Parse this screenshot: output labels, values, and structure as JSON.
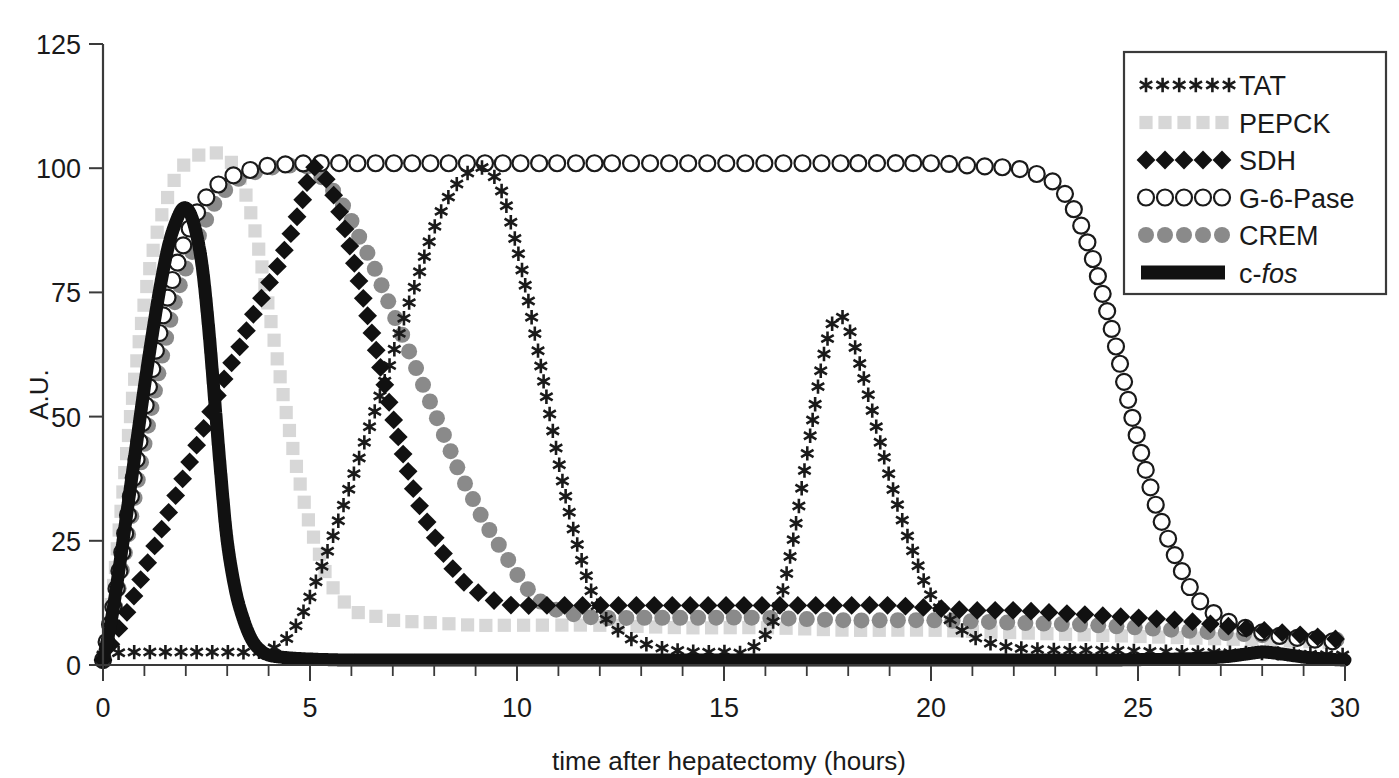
{
  "chart_data": {
    "type": "line",
    "title": "",
    "xlabel": "time after hepatectomy (hours)",
    "ylabel": "A.U.",
    "xlim": [
      0,
      30
    ],
    "ylim": [
      0,
      125
    ],
    "xticks": [
      0,
      5,
      10,
      15,
      20,
      25,
      30
    ],
    "xtick_labels": [
      "0",
      "5",
      "10",
      "15",
      "20",
      "25",
      "30"
    ],
    "xminor_step": 1,
    "yticks": [
      0,
      25,
      50,
      75,
      100,
      125
    ],
    "ytick_labels": [
      "0",
      "25",
      "50",
      "75",
      "100",
      "125"
    ],
    "grid": false,
    "legend_position": "top-right",
    "series": [
      {
        "name": "TAT",
        "marker": "star",
        "color": "#1a1a1a",
        "x": [
          0,
          0.4,
          0.8,
          1.2,
          1.6,
          2,
          2.4,
          2.8,
          3.2,
          3.6,
          4,
          4.4,
          4.8,
          5.2,
          5.6,
          6,
          6.4,
          6.8,
          7.2,
          7.6,
          8,
          8.4,
          8.8,
          9.2,
          9.6,
          10,
          10.4,
          10.8,
          11.2,
          11.6,
          12,
          12.6,
          13.2,
          13.8,
          14.4,
          15,
          15.6,
          16.2,
          16.6,
          17,
          17.4,
          17.7,
          18,
          18.4,
          18.8,
          19.2,
          19.6,
          20,
          20.6,
          21.2,
          22,
          23,
          24,
          25,
          26,
          27,
          28,
          29,
          30
        ],
        "y": [
          2,
          2.5,
          2.6,
          2.6,
          2.6,
          2.6,
          2.6,
          2.6,
          2.6,
          2.6,
          3,
          5,
          10,
          18,
          27,
          37,
          47,
          57,
          68,
          78,
          88,
          95,
          99,
          100,
          96,
          84,
          68,
          50,
          33,
          20,
          11,
          6,
          4,
          3,
          2.6,
          2.6,
          3,
          9,
          22,
          42,
          62,
          70,
          68,
          57,
          44,
          32,
          22,
          14,
          8,
          5,
          3.5,
          3,
          3,
          2.8,
          2.6,
          2.5,
          2.4,
          2.2,
          2
        ]
      },
      {
        "name": "PEPCK",
        "marker": "square",
        "color": "#d7d7d7",
        "x": [
          0,
          0.2,
          0.4,
          0.6,
          0.8,
          1,
          1.2,
          1.4,
          1.6,
          1.8,
          2,
          2.2,
          2.4,
          2.6,
          2.8,
          3,
          3.2,
          3.4,
          3.6,
          3.8,
          4,
          4.2,
          4.4,
          4.6,
          4.8,
          5,
          5.2,
          5.4,
          5.6,
          5.8,
          6,
          6.5,
          7,
          8,
          9,
          10,
          12,
          14,
          16,
          18,
          20,
          22,
          24,
          26,
          28,
          30
        ],
        "y": [
          1,
          12,
          28,
          45,
          60,
          73,
          83,
          90,
          95,
          99,
          101,
          102,
          103,
          103,
          103,
          102,
          100,
          96,
          90,
          82,
          72,
          62,
          52,
          43,
          35,
          28,
          23,
          18,
          15,
          13,
          11,
          10,
          9,
          8.5,
          8,
          8,
          8,
          7.5,
          7.5,
          7,
          7,
          6.5,
          6,
          5.5,
          5,
          4.5
        ]
      },
      {
        "name": "SDH",
        "marker": "diamond",
        "color": "#111111",
        "x": [
          0,
          0.3,
          0.6,
          0.9,
          1.2,
          1.5,
          1.8,
          2.1,
          2.4,
          2.7,
          3,
          3.3,
          3.6,
          3.9,
          4.2,
          4.5,
          4.8,
          5,
          5.2,
          5.5,
          5.8,
          6.1,
          6.4,
          6.7,
          7,
          7.3,
          7.6,
          8,
          8.4,
          8.8,
          9.2,
          9.6,
          10,
          11,
          12,
          13,
          14,
          15,
          16,
          17,
          18,
          19,
          20,
          21,
          22,
          23,
          24,
          25,
          26,
          27,
          28,
          29,
          30
        ],
        "y": [
          1,
          6,
          11,
          17,
          23,
          29,
          35,
          41,
          47,
          53,
          59,
          64,
          70,
          75,
          80,
          86,
          93,
          99,
          100,
          96,
          89,
          80,
          70,
          60,
          50,
          41,
          33,
          26,
          20,
          16,
          14,
          12.5,
          12,
          12,
          12,
          12,
          12,
          12,
          12,
          12,
          12,
          12,
          11.5,
          11,
          11,
          10.5,
          10,
          9.5,
          9,
          8,
          7,
          6,
          5
        ]
      },
      {
        "name": "G-6-Pase",
        "marker": "circle-open",
        "color": "#1a1a1a",
        "x": [
          0,
          0.3,
          0.6,
          0.9,
          1.2,
          1.5,
          1.8,
          2.1,
          2.4,
          2.7,
          3,
          3.5,
          4,
          5,
          6,
          7,
          8,
          9,
          10,
          12,
          14,
          16,
          18,
          20,
          21,
          22,
          22.5,
          23,
          23.3,
          23.6,
          23.9,
          24.2,
          24.5,
          24.8,
          25.1,
          25.4,
          25.7,
          26,
          26.3,
          26.6,
          27,
          27.4,
          27.8,
          28.3,
          28.8,
          29.4,
          30
        ],
        "y": [
          1,
          14,
          30,
          46,
          60,
          72,
          81,
          88,
          93,
          96,
          98,
          99.5,
          100.5,
          101,
          101,
          101,
          101,
          101,
          101,
          101,
          101,
          101,
          101,
          101,
          100.5,
          100,
          99,
          97,
          94,
          89,
          82,
          73,
          63,
          52,
          42,
          33,
          26,
          20,
          15,
          12,
          9.5,
          8,
          7,
          6,
          5.5,
          5,
          4.5
        ]
      },
      {
        "name": "CREM",
        "marker": "circle-filled",
        "color": "#8a8a8a",
        "x": [
          0,
          0.3,
          0.6,
          0.9,
          1.2,
          1.5,
          1.8,
          2.1,
          2.4,
          2.7,
          3,
          3.3,
          3.6,
          4,
          4.4,
          4.8,
          5,
          5.3,
          5.6,
          5.9,
          6.2,
          6.5,
          6.8,
          7.1,
          7.4,
          7.7,
          8,
          8.3,
          8.6,
          8.9,
          9.2,
          9.5,
          9.8,
          10.1,
          10.4,
          10.7,
          11,
          11.5,
          12,
          13,
          14,
          16,
          18,
          20,
          22,
          24,
          26,
          28,
          30
        ],
        "y": [
          1,
          12,
          26,
          40,
          53,
          65,
          75,
          82,
          88,
          93,
          96,
          98,
          99,
          100,
          100.5,
          100.5,
          100,
          98,
          95,
          91,
          86,
          81,
          75,
          69,
          63,
          57,
          51,
          45,
          39,
          34,
          29,
          25,
          21,
          17,
          14,
          12,
          11,
          10,
          9.5,
          9.5,
          9.5,
          9.5,
          9,
          9,
          8.5,
          8,
          7,
          6,
          5
        ]
      },
      {
        "name": "c-fos",
        "marker": "thick-line",
        "color": "#111111",
        "x": [
          0,
          0.2,
          0.4,
          0.6,
          0.8,
          1,
          1.2,
          1.4,
          1.6,
          1.8,
          1.95,
          2.1,
          2.25,
          2.4,
          2.55,
          2.7,
          2.85,
          3,
          3.2,
          3.4,
          3.6,
          3.8,
          4,
          4.4,
          5,
          6,
          8,
          10,
          12,
          14,
          16,
          18,
          20,
          22,
          24,
          26,
          27,
          27.6,
          28,
          28.4,
          29,
          29.5,
          30
        ],
        "y": [
          1,
          9,
          20,
          32,
          44,
          56,
          67,
          77,
          85,
          90,
          92,
          91,
          87,
          80,
          68,
          53,
          38,
          25,
          15,
          9,
          5,
          3,
          2,
          1.5,
          1.2,
          1,
          1,
          1,
          1,
          1,
          1,
          1,
          1,
          1,
          1,
          1.2,
          1.6,
          2.2,
          2.6,
          2.3,
          1.6,
          1.2,
          1
        ]
      }
    ]
  },
  "legend": {
    "items": [
      {
        "label": "TAT",
        "marker": "star",
        "color": "#1a1a1a"
      },
      {
        "label": "PEPCK",
        "marker": "square",
        "color": "#d7d7d7"
      },
      {
        "label": "SDH",
        "marker": "diamond",
        "color": "#111111"
      },
      {
        "label": "G-6-Pase",
        "marker": "circle-open",
        "color": "#1a1a1a"
      },
      {
        "label": "CREM",
        "marker": "circle-filled",
        "color": "#8a8a8a"
      },
      {
        "label": "c-fos",
        "marker": "thick-line",
        "color": "#111111",
        "italic_from": 2
      }
    ]
  }
}
